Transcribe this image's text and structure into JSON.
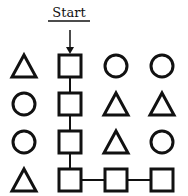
{
  "title": "Start",
  "colors": {
    "stroke": "#111111",
    "background": "#ffffff"
  },
  "grid": {
    "columns": [
      24,
      70,
      116,
      162
    ],
    "rows": [
      66,
      104,
      142,
      180
    ],
    "cells": [
      [
        "triangle",
        "square",
        "circle",
        "circle"
      ],
      [
        "circle",
        "square",
        "triangle",
        "triangle"
      ],
      [
        "circle",
        "square",
        "triangle",
        "circle"
      ],
      [
        "triangle",
        "square",
        "square",
        "square"
      ]
    ]
  },
  "path": [
    [
      0,
      1
    ],
    [
      1,
      1
    ],
    [
      2,
      1
    ],
    [
      3,
      1
    ],
    [
      3,
      2
    ],
    [
      3,
      3
    ]
  ]
}
